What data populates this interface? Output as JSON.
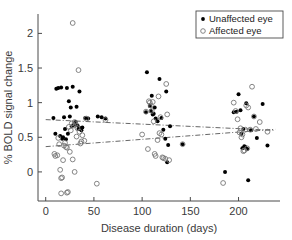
{
  "chart_data": {
    "type": "scatter",
    "title": "",
    "xlabel": "Disease duration (days)",
    "ylabel": "% BOLD signal change",
    "xlim": [
      -8,
      243
    ],
    "ylim": [
      -0.42,
      2.28
    ],
    "xticks": [
      0,
      50,
      100,
      150,
      200
    ],
    "yticks": [
      0,
      0.5,
      1,
      1.5,
      2
    ],
    "xtick_labels": [
      "0",
      "50",
      "100",
      "150",
      "200"
    ],
    "ytick_labels": [
      "0",
      "0.5",
      "1",
      "1.5",
      "2"
    ],
    "grid": false,
    "legend_position": "top-right",
    "series": [
      {
        "name": "Unaffected eye",
        "marker": "filled-circle",
        "color": "#000000",
        "points": [
          [
            8,
            0.78
          ],
          [
            10,
            0.55
          ],
          [
            11,
            1.2
          ],
          [
            13,
            1.21
          ],
          [
            15,
            0.52
          ],
          [
            16,
            1.22
          ],
          [
            17,
            0.48
          ],
          [
            18,
            0.5
          ],
          [
            19,
            0.79
          ],
          [
            20,
            0.62
          ],
          [
            21,
            0.47
          ],
          [
            22,
            1.21
          ],
          [
            23,
            0.55
          ],
          [
            24,
            1.02
          ],
          [
            25,
            0.8
          ],
          [
            26,
            0.93
          ],
          [
            27,
            0.66
          ],
          [
            28,
            1.23
          ],
          [
            29,
            0.68
          ],
          [
            30,
            0.7
          ],
          [
            31,
            0.72
          ],
          [
            32,
            0.94
          ],
          [
            33,
            0.67
          ],
          [
            34,
            0.62
          ],
          [
            35,
            1.16
          ],
          [
            36,
            0.63
          ],
          [
            37,
            0.6
          ],
          [
            38,
            0.64
          ],
          [
            41,
            0.78
          ],
          [
            44,
            0.77
          ],
          [
            54,
            0.8
          ],
          [
            58,
            0.79
          ],
          [
            62,
            0.77
          ],
          [
            104,
            0.86
          ],
          [
            105,
            1.44
          ],
          [
            108,
            0.95
          ],
          [
            109,
            0.88
          ],
          [
            110,
            1.1
          ],
          [
            111,
            0.83
          ],
          [
            112,
            0.84
          ],
          [
            113,
            0.93
          ],
          [
            114,
            0.77
          ],
          [
            116,
            0.73
          ],
          [
            118,
            1.34
          ],
          [
            120,
            0.78
          ],
          [
            122,
            0.61
          ],
          [
            124,
            0.48
          ],
          [
            125,
            1.16
          ],
          [
            126,
            0.14
          ],
          [
            127,
            0.39
          ],
          [
            129,
            0.66
          ],
          [
            142,
            0.4
          ],
          [
            186,
            0.0
          ],
          [
            195,
            0.86
          ],
          [
            198,
            0.87
          ],
          [
            200,
            1.12
          ],
          [
            202,
            0.89
          ],
          [
            203,
            0.55
          ],
          [
            204,
            0.34
          ],
          [
            205,
            0.62
          ],
          [
            206,
            0.37
          ],
          [
            207,
            0.36
          ],
          [
            208,
            0.99
          ],
          [
            209,
            0.33
          ],
          [
            210,
            -0.12
          ],
          [
            213,
            0.6
          ],
          [
            216,
            0.8
          ],
          [
            219,
            0.49
          ],
          [
            225,
            0.98
          ],
          [
            230,
            0.38
          ]
        ]
      },
      {
        "name": "Affected eye",
        "marker": "open-circle",
        "color": "#777777",
        "points": [
          [
            9,
            0.26
          ],
          [
            10,
            0.23
          ],
          [
            12,
            0.24
          ],
          [
            13,
            0.49
          ],
          [
            14,
            0.4
          ],
          [
            15,
            0.03
          ],
          [
            16,
            -0.09
          ],
          [
            16,
            -0.31
          ],
          [
            17,
            -0.08
          ],
          [
            18,
            0.17
          ],
          [
            19,
            0.38
          ],
          [
            20,
            0.42
          ],
          [
            21,
            0.36
          ],
          [
            22,
            0.35
          ],
          [
            22,
            -0.3
          ],
          [
            23,
            -0.29
          ],
          [
            24,
            0.65
          ],
          [
            25,
            0.29
          ],
          [
            26,
            0.6
          ],
          [
            27,
            0.7
          ],
          [
            28,
            2.15
          ],
          [
            28,
            0.18
          ],
          [
            29,
            0.67
          ],
          [
            30,
            0.72
          ],
          [
            30,
            0.0
          ],
          [
            31,
            0.69
          ],
          [
            32,
            0.51
          ],
          [
            33,
            0.63
          ],
          [
            34,
            1.47
          ],
          [
            35,
            0.58
          ],
          [
            36,
            0.41
          ],
          [
            37,
            0.44
          ],
          [
            38,
            0.53
          ],
          [
            40,
            0.45
          ],
          [
            42,
            0.77
          ],
          [
            53,
            -0.17
          ],
          [
            62,
            0.75
          ],
          [
            100,
            0.54
          ],
          [
            104,
            0.87
          ],
          [
            106,
            0.33
          ],
          [
            107,
            1.02
          ],
          [
            108,
            1.0
          ],
          [
            109,
            0.96
          ],
          [
            110,
            0.88
          ],
          [
            111,
            1.01
          ],
          [
            112,
            0.73
          ],
          [
            113,
            0.26
          ],
          [
            114,
            0.23
          ],
          [
            116,
            0.46
          ],
          [
            117,
            1.09
          ],
          [
            118,
            0.56
          ],
          [
            119,
            0.79
          ],
          [
            120,
            0.54
          ],
          [
            121,
            0.21
          ],
          [
            122,
            0.2
          ],
          [
            124,
            0.19
          ],
          [
            125,
            1.27
          ],
          [
            126,
            0.83
          ],
          [
            128,
            0.17
          ],
          [
            142,
            0.4
          ],
          [
            184,
            -0.16
          ],
          [
            195,
            1.0
          ],
          [
            197,
            0.88
          ],
          [
            199,
            0.76
          ],
          [
            201,
            0.57
          ],
          [
            202,
            0.63
          ],
          [
            203,
            0.5
          ],
          [
            204,
            0.54
          ],
          [
            205,
            0.3
          ],
          [
            206,
            0.31
          ],
          [
            207,
            0.61
          ],
          [
            208,
            0.96
          ],
          [
            209,
            0.34
          ],
          [
            210,
            0.93
          ],
          [
            212,
            0.61
          ],
          [
            214,
            1.23
          ],
          [
            216,
            0.8
          ],
          [
            218,
            0.62
          ],
          [
            222,
            0.72
          ],
          [
            230,
            0.58
          ]
        ]
      }
    ],
    "trend_lines": [
      {
        "name": "Unaffected eye trend",
        "style": "dash-dot",
        "color": "#555555",
        "x": [
          0,
          238
        ],
        "y": [
          0.755,
          0.6
        ]
      },
      {
        "name": "Affected eye trend",
        "style": "dash-dot",
        "color": "#555555",
        "x": [
          0,
          238
        ],
        "y": [
          0.365,
          0.615
        ]
      }
    ],
    "legend": [
      {
        "label": "Unaffected eye",
        "marker": "filled-circle"
      },
      {
        "label": "Affected eye",
        "marker": "open-circle"
      }
    ]
  }
}
